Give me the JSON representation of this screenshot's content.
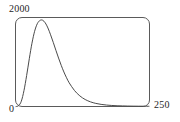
{
  "chart_data": {
    "type": "line",
    "title": "",
    "subtitle": "",
    "xlabel": "",
    "ylabel": "",
    "xlim": [
      0,
      250
    ],
    "ylim": [
      0,
      2000
    ],
    "grid": false,
    "legend": null,
    "axis_labels": {
      "y_max": "2000",
      "x_min": "0",
      "x_max": "250"
    },
    "x_tick_labels": [
      "0",
      "250"
    ],
    "y_tick_labels": [
      "0",
      "2000"
    ],
    "annotations": [],
    "series": [
      {
        "name": "distribution",
        "color": "#4a4a4a",
        "x": [
          0,
          5,
          10,
          15,
          20,
          25,
          30,
          35,
          40,
          45,
          50,
          55,
          60,
          65,
          70,
          75,
          80,
          85,
          90,
          95,
          100,
          110,
          120,
          130,
          140,
          150,
          160,
          170,
          180,
          190,
          200,
          210,
          220,
          230,
          240,
          250
        ],
        "y": [
          0,
          20,
          120,
          360,
          700,
          1080,
          1430,
          1700,
          1870,
          1945,
          1950,
          1890,
          1775,
          1620,
          1450,
          1270,
          1095,
          930,
          780,
          650,
          535,
          360,
          240,
          158,
          105,
          70,
          48,
          33,
          23,
          17,
          13,
          10,
          8,
          7,
          6,
          5
        ]
      }
    ]
  },
  "frame": {
    "border_color": "#5a5a5a",
    "background": "#ffffff",
    "corner_radius": 7
  }
}
